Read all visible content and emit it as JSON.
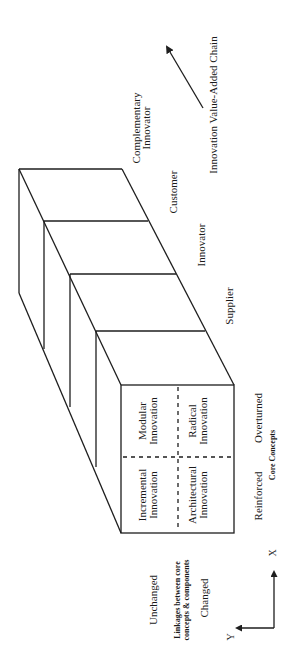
{
  "diagram": {
    "orientation": "rotated 90 degrees counterclockwise",
    "front_face": {
      "cells": [
        {
          "id": "incremental",
          "line1": "Incremental",
          "line2": "Innovation"
        },
        {
          "id": "modular",
          "line1": "Modular",
          "line2": "Innovation"
        },
        {
          "id": "architectural",
          "line1": "Architectural",
          "line2": "Innovation"
        },
        {
          "id": "radical",
          "line1": "Radical",
          "line2": "Innovation"
        }
      ]
    },
    "core_concepts_axis": {
      "title": "Core Concepts",
      "low": "Reinforced",
      "high": "Overturned"
    },
    "linkages_axis": {
      "title_line1": "Linkages between core",
      "title_line2": "concepts & components",
      "low": "Unchanged",
      "high": "Changed"
    },
    "value_chain_stages": [
      {
        "id": "supplier",
        "line1": "Supplier",
        "line2": ""
      },
      {
        "id": "innovator",
        "line1": "Innovator",
        "line2": ""
      },
      {
        "id": "customer",
        "line1": "Customer",
        "line2": ""
      },
      {
        "id": "complementary-innovator",
        "line1": "Complementary",
        "line2": "Innovator"
      }
    ],
    "value_chain_arrow_label": "Innovation Value-Added Chain",
    "axes_indicator": {
      "x_label": "X",
      "y_label": "Y"
    },
    "colors": {
      "line": "#1e1e1e",
      "text": "#1a1a1a",
      "background": "#ffffff"
    }
  }
}
